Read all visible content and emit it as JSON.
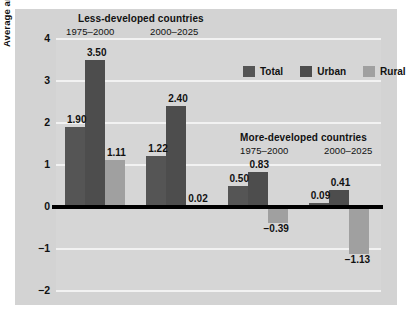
{
  "figure": {
    "partial_caption_above": "",
    "background_color": "#d3d3d3",
    "plot_background_color": "#d6d6d6"
  },
  "axis": {
    "ylabel": "Average annual rate of growth",
    "yticks": [
      "4",
      "3",
      "2",
      "1",
      "0",
      "−1",
      "−2"
    ]
  },
  "legend": {
    "items": [
      {
        "label": "Total",
        "color": "#555555"
      },
      {
        "label": "Urban",
        "color": "#4d4d4d"
      },
      {
        "label": "Rural",
        "color": "#a0a0a0"
      }
    ]
  },
  "groups": [
    {
      "region": "Less-developed countries",
      "period": "1975–2000",
      "labels": [
        "1.90",
        "3.50",
        "1.11"
      ]
    },
    {
      "region": "",
      "period": "2000–2025",
      "labels": [
        "1.22",
        "2.40",
        "0.02"
      ]
    },
    {
      "region": "More-developed countries",
      "period": "1975–2000",
      "labels": [
        "0.50",
        "0.83",
        "−0.39"
      ]
    },
    {
      "region": "",
      "period": "2000–2025",
      "labels": [
        "0.09",
        "0.41",
        "−1.13"
      ]
    }
  ],
  "chart_data": {
    "type": "bar",
    "title": "",
    "subtitle": "",
    "xlabel": "",
    "ylabel": "Average annual rate of growth",
    "ylim": [
      -2,
      4
    ],
    "yticks": [
      4,
      3,
      2,
      1,
      0,
      -1,
      -2
    ],
    "grid": true,
    "grid_color": "#f2f2f2",
    "zero_line": true,
    "legend_position": "top-right",
    "categories": [
      "Less-developed countries 1975–2000",
      "Less-developed countries 2000–2025",
      "More-developed countries 1975–2000",
      "More-developed countries 2000–2025"
    ],
    "series": [
      {
        "name": "Total",
        "color": "#555555",
        "values": [
          1.9,
          1.22,
          0.5,
          0.09
        ]
      },
      {
        "name": "Urban",
        "color": "#4d4d4d",
        "values": [
          3.5,
          2.4,
          0.83,
          0.41
        ]
      },
      {
        "name": "Rural",
        "color": "#a0a0a0",
        "values": [
          1.11,
          0.02,
          -0.39,
          -1.13
        ]
      }
    ],
    "data_labels": [
      [
        "1.90",
        "3.50",
        "1.11"
      ],
      [
        "1.22",
        "2.40",
        "0.02"
      ],
      [
        "0.50",
        "0.83",
        "−0.39"
      ],
      [
        "0.09",
        "0.41",
        "−1.13"
      ]
    ],
    "annotations": [
      {
        "text": "Less-developed countries",
        "type": "group-header"
      },
      {
        "text": "1975–2000",
        "type": "period-header"
      },
      {
        "text": "2000–2025",
        "type": "period-header"
      },
      {
        "text": "More-developed countries",
        "type": "group-header"
      },
      {
        "text": "1975–2000",
        "type": "period-header"
      },
      {
        "text": "2000–2025",
        "type": "period-header"
      }
    ]
  }
}
